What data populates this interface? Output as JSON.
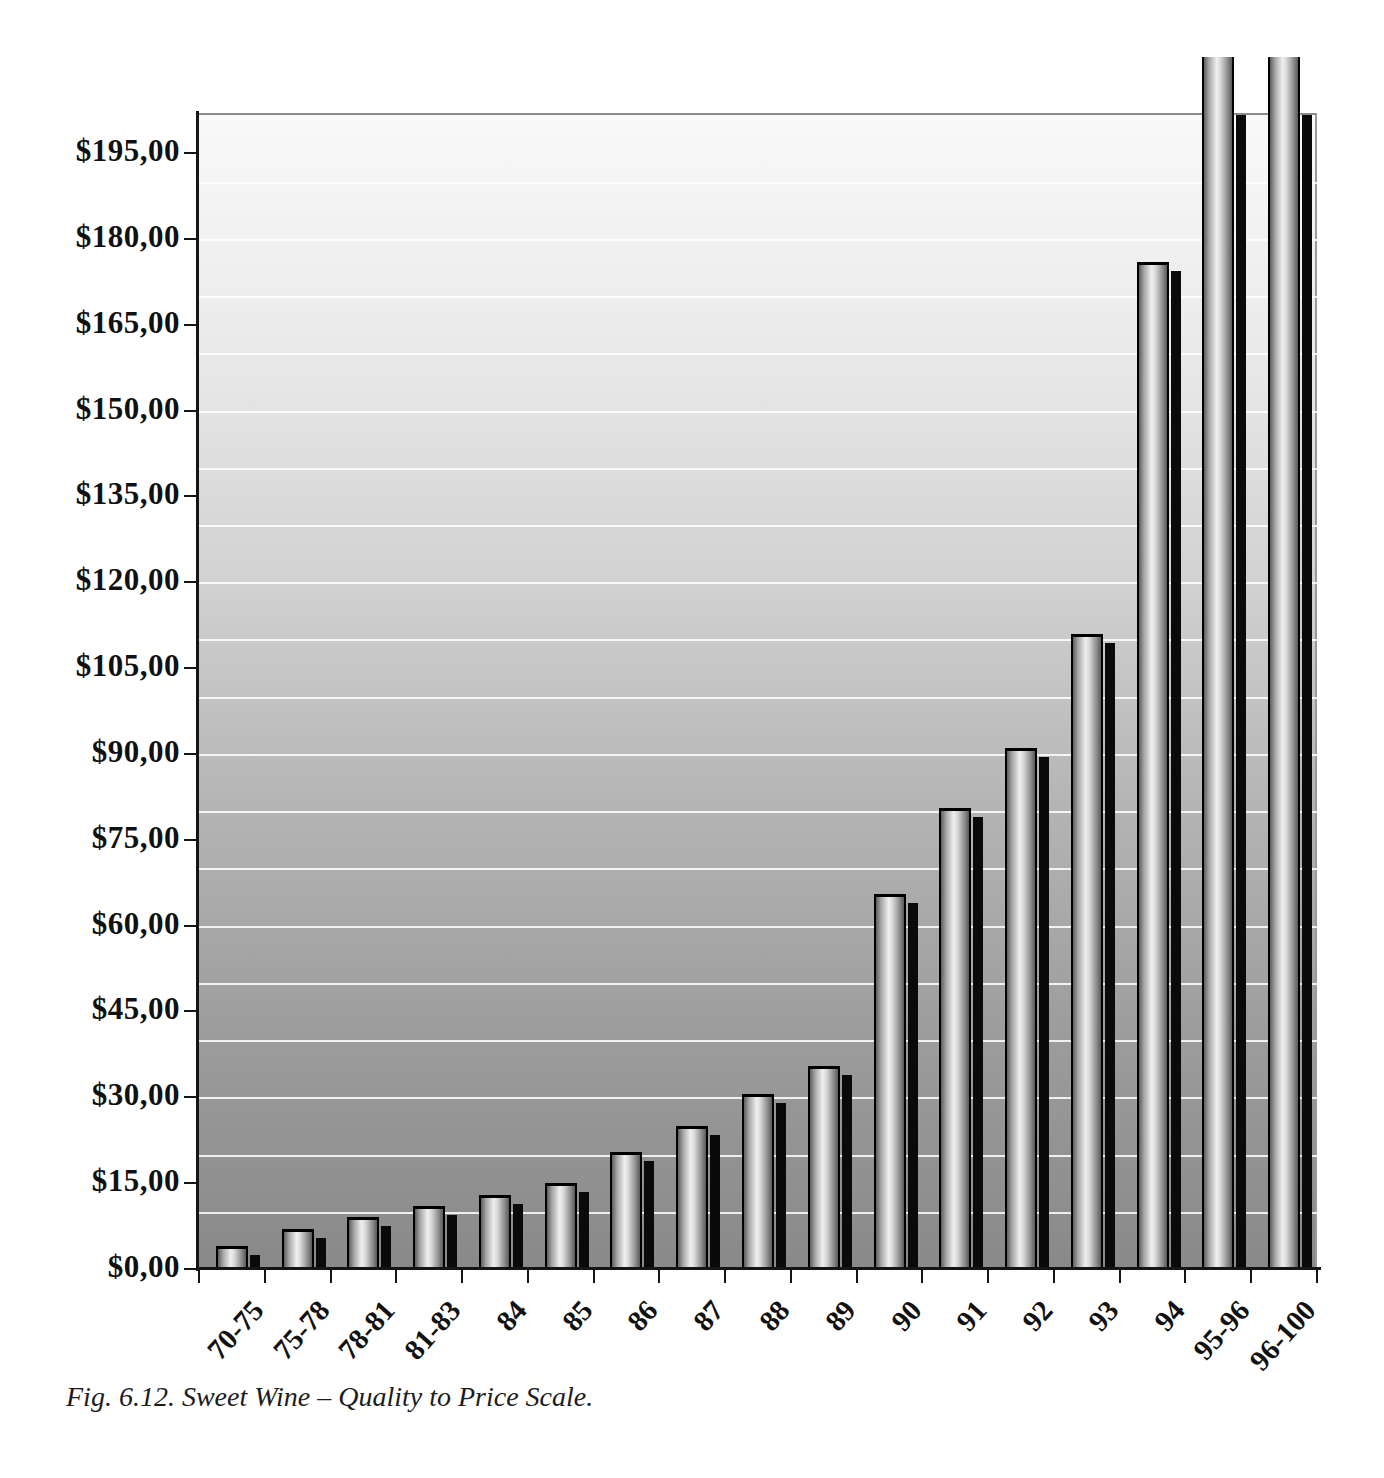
{
  "figure": {
    "caption": "Fig. 6.12. Sweet Wine – Quality to Price Scale."
  },
  "chart_data": {
    "type": "bar",
    "title": "",
    "categories": [
      "70-75",
      "75-78",
      "78-81",
      "81-83",
      "84",
      "85",
      "86",
      "87",
      "88",
      "89",
      "90",
      "91",
      "92",
      "93",
      "94",
      "95-96",
      "96-100"
    ],
    "values": [
      4,
      7,
      9,
      11,
      13,
      15,
      20.5,
      25,
      30.5,
      35.5,
      65.5,
      80.5,
      91,
      111,
      176,
      null,
      null
    ],
    "clipped_above_ymax": [
      "95-96",
      "96-100"
    ],
    "y_axis": {
      "tick_values": [
        0,
        15,
        30,
        45,
        60,
        75,
        90,
        105,
        120,
        135,
        150,
        165,
        180,
        195
      ],
      "tick_labels": [
        "$0,00",
        "$15,00",
        "$30,00",
        "$45,00",
        "$60,00",
        "$75,00",
        "$90,00",
        "$105,00",
        "$120,00",
        "$135,00",
        "$150,00",
        "$165,00",
        "$180,00",
        "$195,00"
      ],
      "gridline_step": 10,
      "ylim": [
        0,
        202
      ]
    },
    "x_axis": {
      "tick_count": 18
    },
    "grid": "horizontal white lines every $10",
    "legend": "none",
    "colors": {
      "background_stops": [
        "#f9f9f9",
        "#eaeaea",
        "#d2d2d2",
        "#b4b4b4",
        "#9c9c9c",
        "#898989"
      ],
      "bar_stops": [
        "#5e5e5e",
        "#a6a6a6",
        "#efefef",
        "#dadada",
        "#949494",
        "#5a5a5a"
      ],
      "bar_outline": "#000000",
      "bar_shadow": "#0a0a0a",
      "gridline": "#ffffff",
      "axis": "#151515",
      "frame": "#8a8a8a",
      "text": "#111111"
    }
  }
}
